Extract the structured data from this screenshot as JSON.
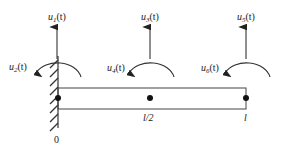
{
  "diagram": {
    "type": "beam-element-dofs",
    "colors": {
      "stroke": "#333333",
      "text": "#222222",
      "background": "#ffffff"
    },
    "nodes": [
      {
        "id": "node-0",
        "position_label": "0",
        "x": 58,
        "translation": {
          "label": "u",
          "sub": "1",
          "arg": "(t)"
        },
        "rotation": {
          "label": "u",
          "sub": "2",
          "arg": "(t)"
        }
      },
      {
        "id": "node-mid",
        "position_label": "l/2",
        "x": 150,
        "translation": {
          "label": "u",
          "sub": "3",
          "arg": "(t)"
        },
        "rotation": {
          "label": "u",
          "sub": "4",
          "arg": "(t)"
        }
      },
      {
        "id": "node-end",
        "position_label": "l",
        "x": 246,
        "translation": {
          "label": "u",
          "sub": "5",
          "arg": "(t)"
        },
        "rotation": {
          "label": "u",
          "sub": "6",
          "arg": "(t)"
        }
      }
    ],
    "support": {
      "type": "fixed-wall",
      "side": "left"
    }
  }
}
